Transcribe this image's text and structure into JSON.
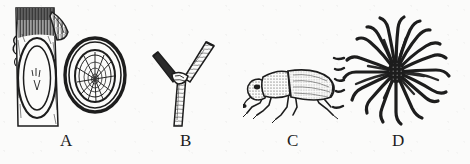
{
  "figure": {
    "kind": "scientific-illustration-plate",
    "background_color": "#fbfbfa",
    "ink_color": "#1d1d1d",
    "width_px": 470,
    "height_px": 164,
    "panel_count": 4,
    "panels": [
      {
        "id": "A",
        "label": "A",
        "subject": "tree stem with oval bark lesion and branch stub, beside a cross-section of the stem showing annual growth rings and radial cracks",
        "elements": [
          "bark-stem",
          "oval-canker-scar",
          "branch-stub",
          "cross-section-disc",
          "growth-rings",
          "radial-cracks"
        ]
      },
      {
        "id": "B",
        "label": "B",
        "subject": "forked twig with two cut-off branch tips",
        "elements": [
          "twig-main-stem",
          "twig-fork-left",
          "twig-fork-right",
          "cut-tips"
        ]
      },
      {
        "id": "C",
        "label": "C",
        "subject": "adult bark beetle in lateral view with stippled elytra and six legs",
        "elements": [
          "beetle-head",
          "beetle-pronotum",
          "beetle-elytra",
          "beetle-legs",
          "beetle-antenna"
        ]
      },
      {
        "id": "D",
        "label": "D",
        "subject": "bark beetle egg gallery pattern, numerous larval galleries radiating from a central nuptial chamber",
        "elements": [
          "central-chamber",
          "radiating-larval-galleries"
        ]
      }
    ]
  },
  "labels": {
    "a": "A",
    "b": "B",
    "c": "C",
    "d": "D"
  }
}
